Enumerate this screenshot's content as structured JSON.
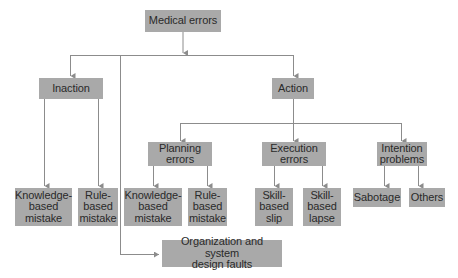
{
  "diagram": {
    "root": {
      "label": "Medical errors"
    },
    "level1": [
      {
        "label": "Inaction"
      },
      {
        "label": "Action"
      }
    ],
    "inaction_children": [
      {
        "label": "Knowledge-\nbased\nmistake"
      },
      {
        "label": "Rule-\nbased\nmistake"
      }
    ],
    "action_children": [
      {
        "label": "Planning\nerrors"
      },
      {
        "label": "Execution\nerrors"
      },
      {
        "label": "Intention\nproblems"
      }
    ],
    "planning_children": [
      {
        "label": "Knowledge-\nbased\nmistake"
      },
      {
        "label": "Rule-\nbased\nmistake"
      }
    ],
    "execution_children": [
      {
        "label": "Skill-\nbased\nslip"
      },
      {
        "label": "Skill-\nbased\nlapse"
      }
    ],
    "intention_children": [
      {
        "label": "Sabotage"
      },
      {
        "label": "Others"
      }
    ],
    "organization": {
      "label": "Organization and system\ndesign faults"
    },
    "colors": {
      "box_fill": "#a9a9a9",
      "line": "#8c8c8c",
      "text": "#2a2a2a"
    }
  }
}
